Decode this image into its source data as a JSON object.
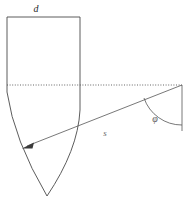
{
  "figure": {
    "background_color": "#ffffff",
    "line_color": "#4a4a4a",
    "label_color": "#2b2b2b",
    "width": 188,
    "height": 209
  },
  "labels": {
    "d": {
      "text": "d",
      "x": 36,
      "y": 12,
      "meaning": "width-dimension-label"
    },
    "s": {
      "text": "s",
      "x": 105,
      "y": 136,
      "meaning": "slant-distance-label"
    },
    "phi": {
      "text": "φ",
      "x": 155,
      "y": 122,
      "meaning": "angle-label"
    }
  },
  "geometry": {
    "body_outline": {
      "name": "bullet-outline",
      "top_left_x": 7,
      "top_right_x": 80,
      "top_y": 17,
      "shoulder_y": 85,
      "apex_x": 47,
      "apex_y": 196,
      "path": "M 7 17 L 80 17 L 80 110 Q 78 150 47 196 Q 14 140 7 92 Z"
    },
    "baseline": {
      "name": "horizontal-dotted-baseline",
      "x1": 7,
      "y1": 85,
      "x2": 182,
      "y2": 85,
      "style": "dotted"
    },
    "slant_arrow": {
      "name": "slant-distance-arrow",
      "x1": 182,
      "y1": 85,
      "x2": 24,
      "y2": 147,
      "arrowhead_at": "start-end-left"
    },
    "vertical_ref": {
      "name": "right-vertical-reference",
      "x1": 182,
      "y1": 85,
      "x2": 182,
      "y2": 131
    },
    "angle_arc": {
      "name": "phi-angle-arc",
      "center_x": 182,
      "center_y": 85,
      "radius": 40,
      "path": "M 144 98 A 40 40 0 0 0 182 125"
    }
  }
}
